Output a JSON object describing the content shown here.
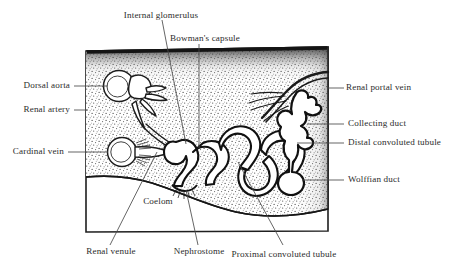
{
  "figure": {
    "kind": "anatomical-diagram",
    "frame": {
      "border_color": "#1a1a1a",
      "tissue_fill": "#f2f2f2",
      "coelom_fill": "#ffffff"
    }
  },
  "labels": {
    "internal_glomerulus": "Internal glomerulus",
    "bowmans_capsule": "Bowman's capsule",
    "dorsal_aorta": "Dorsal aorta",
    "renal_artery": "Renal artery",
    "cardinal_vein": "Cardinal vein",
    "renal_portal_vein": "Renal portal vein",
    "collecting_duct": "Collecting duct",
    "distal_convoluted_tubule": "Distal convoluted tubule",
    "wolffian_duct": "Wolffian duct",
    "coelom": "Coelom",
    "renal_venule": "Renal venule",
    "nephrostome": "Nephrostome",
    "proximal_convoluted_tubule": "Proximal convoluted tubule"
  },
  "colors": {
    "ink": "#2b2b2b",
    "line": "#3a3a3a",
    "stipple": "#555555",
    "lumen": "#ffffff"
  }
}
